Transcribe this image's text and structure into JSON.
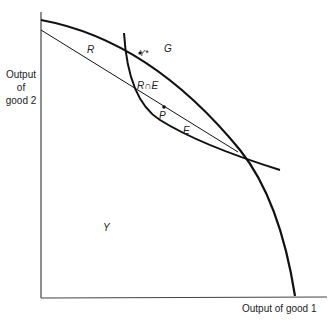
{
  "axes": {
    "y_label_line1": "Output",
    "y_label_line2": "of",
    "y_label_line3": "good 2",
    "x_label": "Output of good 1"
  },
  "labels": {
    "R": "R",
    "G": "G",
    "Y_star": "Y*",
    "R_cap_E": "R∩E",
    "P": "P",
    "E": "E",
    "Y": "Y"
  },
  "colors": {
    "curve": "#111111",
    "axis": "#444444",
    "text": "#222222"
  }
}
